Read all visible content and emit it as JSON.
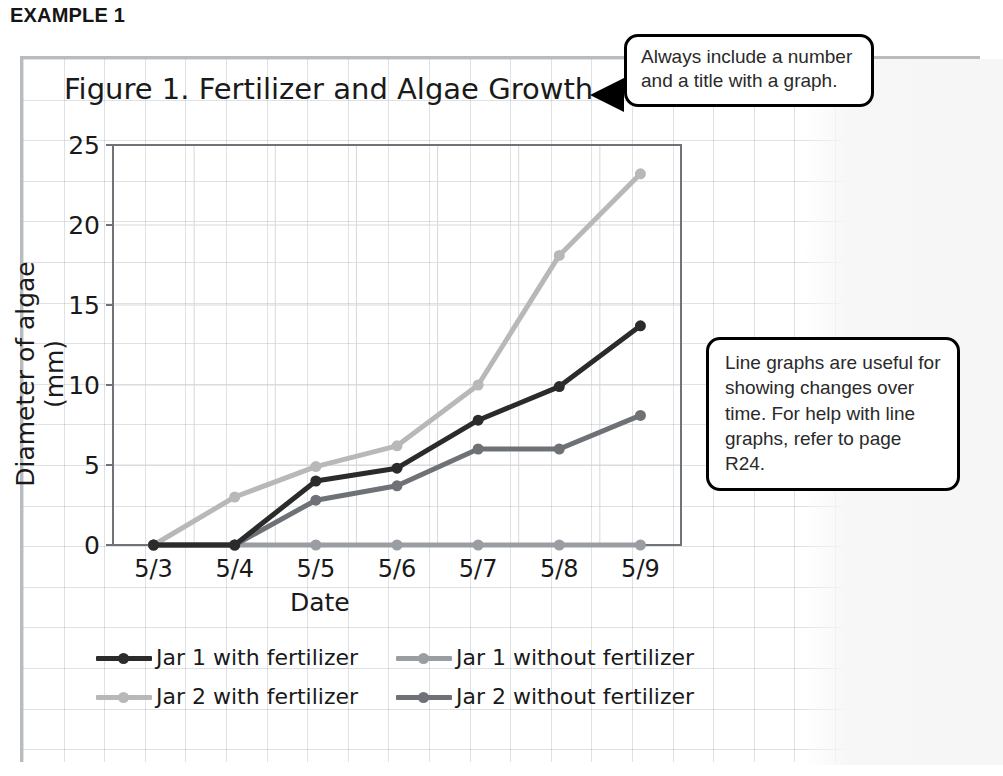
{
  "heading": "EXAMPLE 1",
  "figure": {
    "title": "Figure 1. Fertilizer and Algae Growth"
  },
  "axes": {
    "x_title": "Date",
    "y_title": "Diameter of algae (mm)"
  },
  "callouts": [
    {
      "name": "title-callout",
      "text": "Always include a number and a title with a graph."
    },
    {
      "name": "line-graph-callout",
      "text": "Line graphs are useful for showing changes over time. For help with line graphs, refer to page R24."
    }
  ],
  "legend": [
    {
      "label": "Jar 1 with fertilizer",
      "color": "#2b2b2b"
    },
    {
      "label": "Jar 1 without fertilizer",
      "color": "#9a9ea3"
    },
    {
      "label": "Jar 2 with fertilizer",
      "color": "#b8b8b8"
    },
    {
      "label": "Jar 2 without fertilizer",
      "color": "#6e7276"
    }
  ],
  "chart_data": {
    "type": "line",
    "title": "Figure 1. Fertilizer and Algae Growth",
    "xlabel": "Date",
    "ylabel": "Diameter of algae (mm)",
    "categories": [
      "5/3",
      "5/4",
      "5/5",
      "5/6",
      "5/7",
      "5/8",
      "5/9"
    ],
    "yticks": [
      0,
      5,
      10,
      15,
      20,
      25
    ],
    "ylim": [
      0,
      25
    ],
    "grid": true,
    "legend_position": "bottom",
    "series": [
      {
        "name": "Jar 1 with fertilizer",
        "color": "#2b2b2b",
        "values": [
          0,
          0,
          4.0,
          4.8,
          7.8,
          9.9,
          13.7
        ]
      },
      {
        "name": "Jar 1 without fertilizer",
        "color": "#9a9ea3",
        "values": [
          0,
          0,
          0,
          0,
          0,
          0,
          0
        ]
      },
      {
        "name": "Jar 2 with fertilizer",
        "color": "#b8b8b8",
        "values": [
          0,
          3.0,
          4.9,
          6.2,
          10.0,
          18.1,
          23.2
        ]
      },
      {
        "name": "Jar 2 without fertilizer",
        "color": "#6e7276",
        "values": [
          0,
          0,
          2.8,
          3.7,
          6.0,
          6.0,
          8.1
        ]
      }
    ]
  },
  "plot_geometry": {
    "left": 113,
    "right": 681,
    "top": 145,
    "bottom": 545
  }
}
